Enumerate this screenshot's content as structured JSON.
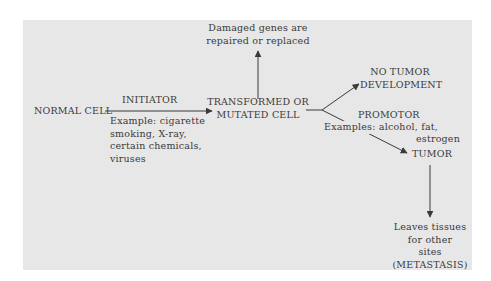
{
  "diagram": {
    "nodes": {
      "normal_cell": "NORMAL CELL",
      "transformed_line1": "TRANSFORMED OR",
      "transformed_line2": "MUTATED CELL",
      "repaired_line1": "Damaged genes are",
      "repaired_line2": "repaired or replaced",
      "no_tumor_line1": "NO TUMOR",
      "no_tumor_line2": "DEVELOPMENT",
      "tumor": "TUMOR",
      "metastasis_line1": "Leaves tissues",
      "metastasis_line2": "for other",
      "metastasis_line3": "sites",
      "metastasis_line4": "(METASTASIS)"
    },
    "edges": {
      "initiator_label": "INITIATOR",
      "initiator_examples": [
        "Example: cigarette",
        "smoking, X-ray,",
        "certain chemicals,",
        "viruses"
      ],
      "promotor_label": "PROMOTOR",
      "promotor_examples": [
        "Examples: alcohol, fat,",
        "estrogen"
      ]
    },
    "colors": {
      "panel_background": "#e7e7e7",
      "ink": "#3a3a3a"
    }
  }
}
